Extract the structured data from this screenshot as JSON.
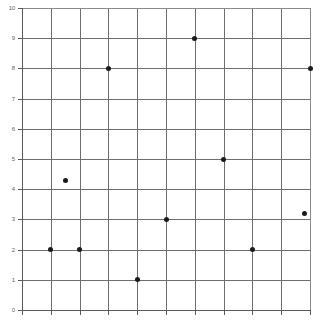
{
  "chart_data": {
    "type": "scatter",
    "title": "",
    "subtitle": "",
    "xlabel": "",
    "ylabel": "",
    "xlim": [
      0,
      10
    ],
    "ylim": [
      0,
      10
    ],
    "grid": true,
    "legend": null,
    "marker": {
      "shape": "circle",
      "color": "#1a1a1a",
      "size": 5
    },
    "y_ticks": [
      0,
      1,
      2,
      3,
      4,
      5,
      6,
      7,
      8,
      9,
      10
    ],
    "y_tick_labels": [
      "0",
      "1",
      "2",
      "3",
      "4",
      "5",
      "6",
      "7",
      "8",
      "9",
      "10"
    ],
    "x_ticks": [
      0,
      1,
      2,
      3,
      4,
      5,
      6,
      7,
      8,
      9,
      10
    ],
    "x_tick_labels": [
      "",
      "",
      "",
      "",
      "",
      "",
      "",
      "",
      "",
      "",
      ""
    ],
    "x_tick_labels_visible": false,
    "points": [
      {
        "x": 1.0,
        "y": 2.0
      },
      {
        "x": 1.5,
        "y": 4.3
      },
      {
        "x": 2.0,
        "y": 2.0
      },
      {
        "x": 3.0,
        "y": 8.0
      },
      {
        "x": 4.0,
        "y": 1.0
      },
      {
        "x": 5.0,
        "y": 3.0
      },
      {
        "x": 6.0,
        "y": 9.0
      },
      {
        "x": 7.0,
        "y": 5.0
      },
      {
        "x": 8.0,
        "y": 2.0
      },
      {
        "x": 9.8,
        "y": 3.2
      },
      {
        "x": 10.0,
        "y": 8.0
      }
    ],
    "colors": {
      "background": "#ffffff",
      "grid": "#6e6e6e",
      "axis": "#5a5a5a",
      "marker": "#1a1a1a",
      "tick_label": "#5f5f5f"
    }
  }
}
